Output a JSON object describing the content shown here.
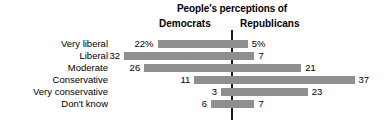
{
  "chart_data": {
    "type": "bar",
    "title": "People's perceptions of",
    "xlabel": "",
    "ylabel": "",
    "grid": false,
    "orientation": "horizontal-diverging",
    "axis_center_label": "",
    "legend_position": "top",
    "series": [
      {
        "name": "Democrats",
        "side": "left",
        "values": [
          22,
          32,
          26,
          11,
          3,
          6
        ],
        "value_labels": [
          "22%",
          "32",
          "26",
          "11",
          "3",
          "6"
        ]
      },
      {
        "name": "Republicans",
        "side": "right",
        "values": [
          5,
          7,
          21,
          37,
          23,
          7
        ],
        "value_labels": [
          "5%",
          "7",
          "21",
          "37",
          "23",
          "7"
        ]
      }
    ],
    "categories": [
      "Very liberal",
      "Liberal",
      "Moderate",
      "Conservative",
      "Very conservative",
      "Don't know"
    ],
    "units": "percent",
    "colors": {
      "bar": "#8f8f8f",
      "axis": "#1a1a1a",
      "text": "#000000",
      "background": "#ffffff"
    }
  },
  "headers": {
    "main_title": "People's perceptions of",
    "left_column": "Democrats",
    "right_column": "Republicans"
  },
  "rows": [
    {
      "category": "Very liberal",
      "left_label": "22%",
      "right_label": "5%"
    },
    {
      "category": "Liberal",
      "left_label": "32",
      "right_label": "7"
    },
    {
      "category": "Moderate",
      "left_label": "26",
      "right_label": "21"
    },
    {
      "category": "Conservative",
      "left_label": "11",
      "right_label": "37"
    },
    {
      "category": "Very conservative",
      "left_label": "3",
      "right_label": "23"
    },
    {
      "category": "Don't know",
      "left_label": "6",
      "right_label": "7"
    }
  ]
}
